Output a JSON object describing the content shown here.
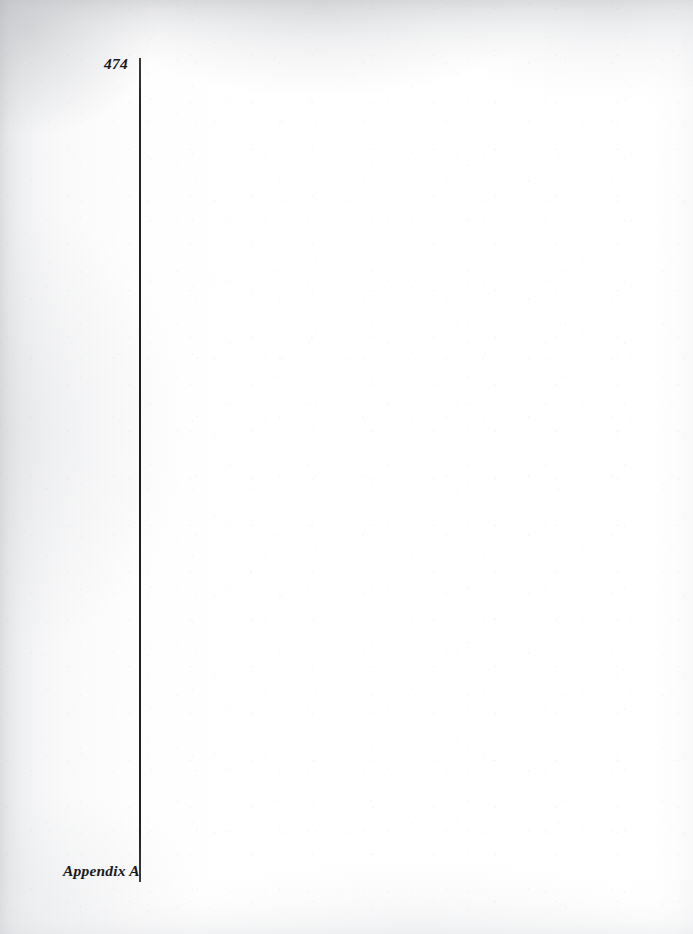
{
  "document": {
    "kind": "scanned-book-page",
    "page_number": "474",
    "running_foot": "Appendix A",
    "body_text": "",
    "ink_color": "#1b1b1d",
    "paper_color": "#ffffff",
    "rule_color": "#1d1d1f"
  },
  "header": {
    "folio": "474"
  },
  "footer": {
    "section_label": "Appendix A"
  },
  "rule": {
    "label": "vertical-rule"
  }
}
